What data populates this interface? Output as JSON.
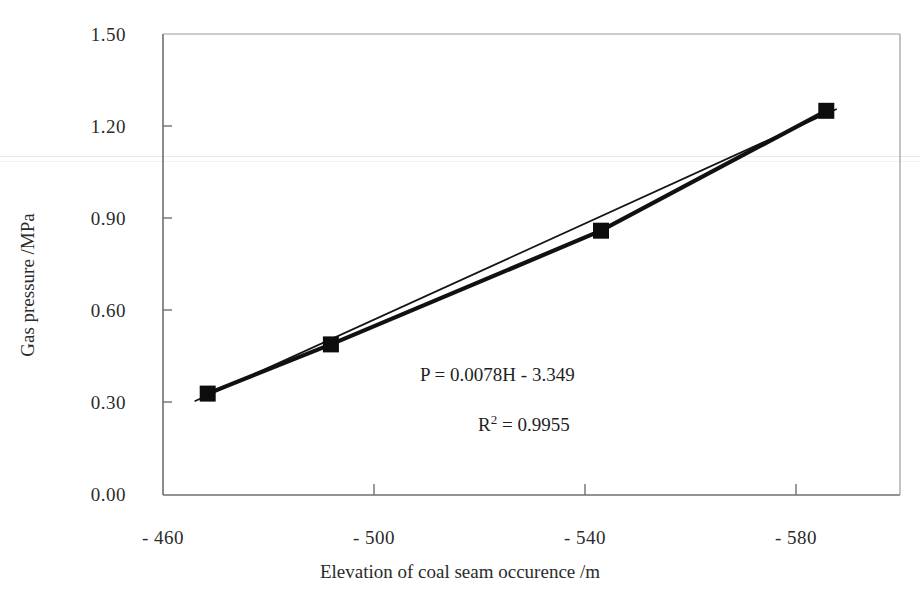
{
  "chart_data": {
    "type": "line",
    "title": "",
    "xlabel": "Elevation of coal seam occurence /m",
    "ylabel": "Gas pressure /MPa",
    "xlim": [
      -460,
      -600
    ],
    "ylim": [
      0.0,
      1.5
    ],
    "x_tick_labels": [
      "- 460",
      "- 500",
      "- 540",
      "- 580"
    ],
    "x_tick_values": [
      -460,
      -500,
      -540,
      -580
    ],
    "y_tick_labels": [
      "0.00",
      "0.30",
      "0.60",
      "0.90",
      "1.20",
      "1.50"
    ],
    "y_tick_values": [
      0.0,
      0.3,
      0.6,
      0.9,
      1.2,
      1.5
    ],
    "grid": false,
    "legend": "none",
    "series": [
      {
        "name": "Gas pressure",
        "marker": "filled-square",
        "color": "#111111",
        "x": [
          -468.5,
          -491.9,
          -543.2,
          -586.0
        ],
        "y": [
          0.33,
          0.49,
          0.86,
          1.25
        ]
      },
      {
        "name": "Linear trendline",
        "marker": "none",
        "color": "#111111",
        "x": [
          -466.0,
          -588.0
        ],
        "y": [
          0.3048,
          1.2564
        ]
      }
    ],
    "annotations": [
      {
        "id": "equation",
        "text": "P = 0.0078H - 3.349",
        "x": -516,
        "y": 0.575
      },
      {
        "id": "r-squared",
        "text_base": "R",
        "text_sup": "2",
        "text_rest": " =  0.9955",
        "x": -516,
        "y": 0.425
      }
    ]
  }
}
